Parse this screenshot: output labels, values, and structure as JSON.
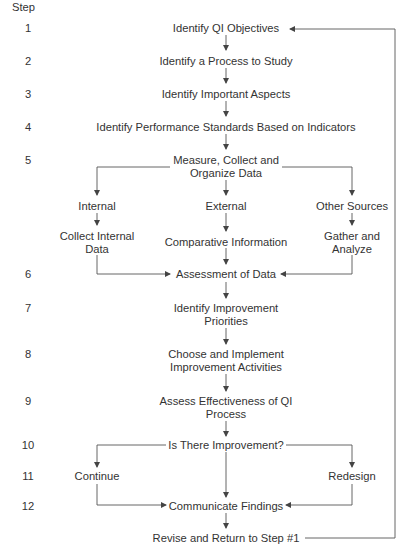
{
  "header": {
    "step_label": "Step"
  },
  "steps": [
    {
      "number": "1",
      "label": "Identify QI Objectives"
    },
    {
      "number": "2",
      "label": "Identify a Process to Study"
    },
    {
      "number": "3",
      "label": "Identify Important Aspects"
    },
    {
      "number": "4",
      "label": "Identify Performance Standards Based on Indicators"
    },
    {
      "number": "5",
      "label_line1": "Measure, Collect and",
      "label_line2": "Organize Data"
    },
    {
      "number": "6",
      "label": "Assessment of Data"
    },
    {
      "number": "7",
      "label_line1": "Identify Improvement",
      "label_line2": "Priorities"
    },
    {
      "number": "8",
      "label_line1": "Choose and Implement",
      "label_line2": "Improvement Activities"
    },
    {
      "number": "9",
      "label_line1": "Assess Effectiveness of QI",
      "label_line2": "Process"
    },
    {
      "number": "10",
      "label": "Is There Improvement?"
    },
    {
      "number": "11"
    },
    {
      "number": "12",
      "label": "Communicate Findings"
    }
  ],
  "branches": {
    "internal": {
      "label": "Internal",
      "sub_line1": "Collect Internal",
      "sub_line2": "Data"
    },
    "external": {
      "label": "External",
      "sub": "Comparative Information"
    },
    "other": {
      "label": "Other Sources",
      "sub_line1": "Gather and",
      "sub_line2": "Analyze"
    }
  },
  "decision": {
    "yes": "Continue",
    "no": "Redesign"
  },
  "final": {
    "label": "Revise and Return to Step #1"
  },
  "colors": {
    "line": "#555555",
    "text": "#333333"
  }
}
